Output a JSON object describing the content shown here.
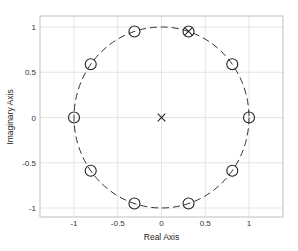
{
  "chart_data": {
    "type": "scatter",
    "title": "",
    "xlabel": "Real Axis",
    "ylabel": "Imaginary Axis",
    "xlim": [
      -1.3,
      1.4
    ],
    "ylim": [
      -1.1,
      1.1
    ],
    "grid": true,
    "xticks": [
      -1,
      -0.5,
      0,
      0.5,
      1
    ],
    "xtick_labels": [
      "-1",
      "-0.5",
      "0",
      "0.5",
      "1"
    ],
    "yticks": [
      -1,
      -0.5,
      0,
      0.5,
      1
    ],
    "ytick_labels": [
      "-1",
      "-0.5",
      "0",
      "0.5",
      "1"
    ],
    "unit_circle": {
      "radius": 1,
      "style": "dashed"
    },
    "series": [
      {
        "name": "zeros",
        "marker": "o",
        "points": [
          [
            1.0,
            0.0
          ],
          [
            0.809,
            0.588
          ],
          [
            0.309,
            0.951
          ],
          [
            -0.309,
            0.951
          ],
          [
            -0.809,
            0.588
          ],
          [
            -1.0,
            0.0
          ],
          [
            -0.809,
            -0.588
          ],
          [
            -0.309,
            -0.951
          ],
          [
            0.309,
            -0.951
          ],
          [
            0.809,
            -0.588
          ]
        ]
      },
      {
        "name": "poles",
        "marker": "x",
        "points": [
          [
            0.0,
            0.0
          ],
          [
            0.309,
            0.951
          ]
        ]
      }
    ]
  },
  "colors": {
    "marker": "#222222",
    "grid": "#dedede",
    "axes": "#b0b0b0",
    "circle": "#333333"
  }
}
